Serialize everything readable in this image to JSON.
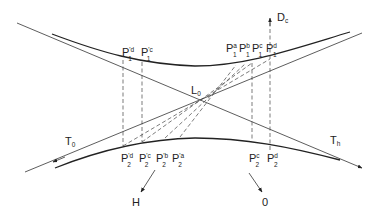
{
  "diagram": {
    "center_label": "L",
    "center_sub": "0",
    "axis_label": "D",
    "axis_sub": "c",
    "tangent_left_label": "T",
    "tangent_left_sub": "0",
    "tangent_right_label": "T",
    "tangent_right_sub": "h",
    "arrow_h_label": "H",
    "arrow_o_label": "0",
    "upper_points": [
      {
        "base": "P",
        "sub": "1",
        "sup": "'d"
      },
      {
        "base": "P",
        "sub": "1",
        "sup": "'c"
      },
      {
        "base": "P",
        "sub": "1",
        "sup": "a"
      },
      {
        "base": "P",
        "sub": "1",
        "sup": "b"
      },
      {
        "base": "P",
        "sub": "1",
        "sup": "c"
      },
      {
        "base": "P",
        "sub": "1",
        "sup": "d"
      }
    ],
    "lower_points": [
      {
        "base": "P",
        "sub": "2",
        "sup": "'d"
      },
      {
        "base": "P",
        "sub": "2",
        "sup": "'c"
      },
      {
        "base": "P",
        "sub": "2",
        "sup": "'b"
      },
      {
        "base": "P",
        "sub": "2",
        "sup": "'a"
      },
      {
        "base": "P",
        "sub": "2",
        "sup": "c"
      },
      {
        "base": "P",
        "sub": "2",
        "sup": "d"
      }
    ]
  }
}
